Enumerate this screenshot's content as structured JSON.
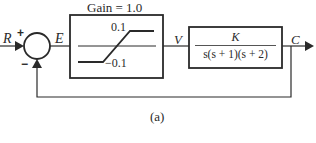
{
  "figure": {
    "caption": "(a)",
    "input_label": "R",
    "error_label": "E",
    "nonlinear_output_label": "V",
    "output_label": "C",
    "summing_junction": {
      "plus_sign": "+",
      "minus_sign": "−"
    },
    "saturation_block": {
      "title": "Gain = 1.0",
      "upper_limit_label": "0.1",
      "lower_limit_label": "−0.1"
    },
    "plant_block": {
      "numerator": "K",
      "denominator": "s(s + 1)(s + 2)"
    },
    "colors": {
      "line": "#2a2a2a",
      "background": "#ffffff"
    }
  }
}
